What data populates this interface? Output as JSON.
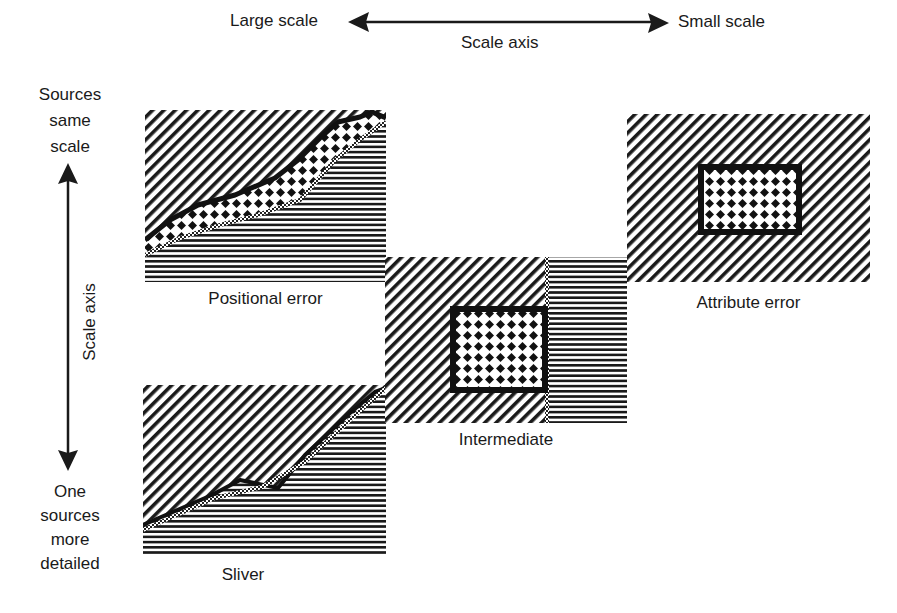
{
  "horizontal_axis": {
    "left_label": "Large scale",
    "right_label": "Small scale",
    "axis_label": "Scale axis"
  },
  "vertical_axis": {
    "top_label_lines": [
      "Sources",
      "same",
      "scale"
    ],
    "bottom_label_lines": [
      "One",
      "sources",
      "more",
      "detailed"
    ],
    "axis_label": "Scale axis"
  },
  "panels": [
    {
      "id": "positional-error",
      "label": "Positional error"
    },
    {
      "id": "sliver",
      "label": "Sliver"
    },
    {
      "id": "intermediate",
      "label": "Intermediate"
    },
    {
      "id": "attribute-error",
      "label": "Attribute error"
    }
  ],
  "colors": {
    "ink": "#1a1a1a",
    "background": "#ffffff"
  }
}
